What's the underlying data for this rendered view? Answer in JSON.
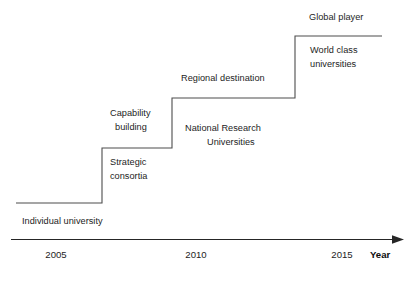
{
  "diagram": {
    "type": "step-progression-timeline",
    "axis": {
      "label": "Year",
      "ticks": [
        "2005",
        "2010",
        "2015"
      ],
      "arrow": "right-arrow-icon"
    },
    "steps": [
      {
        "stage_label": "Individual university",
        "above_label": "",
        "level": 1
      },
      {
        "stage_label": "Strategic\nconsortia",
        "above_label": "Capability\nbuilding",
        "level": 2
      },
      {
        "stage_label": "National Research\nUniversities",
        "above_label": "Regional destination",
        "level": 3
      },
      {
        "stage_label": "World class\nuniversities",
        "above_label": "Global player",
        "level": 4
      }
    ],
    "labels": {
      "individual_university": "Individual university",
      "strategic_consortia_l1": "Strategic",
      "strategic_consortia_l2": "consortia",
      "capability_building_l1": "Capability",
      "capability_building_l2": "building",
      "national_research_l1": "National Research",
      "national_research_l2": "Universities",
      "regional_destination": "Regional destination",
      "world_class_l1": "World class",
      "world_class_l2": "universities",
      "global_player": "Global player"
    },
    "colors": {
      "line": "#4d4d4d",
      "axis": "#262626",
      "text": "#1d1d1d",
      "background": "#ffffff"
    }
  }
}
